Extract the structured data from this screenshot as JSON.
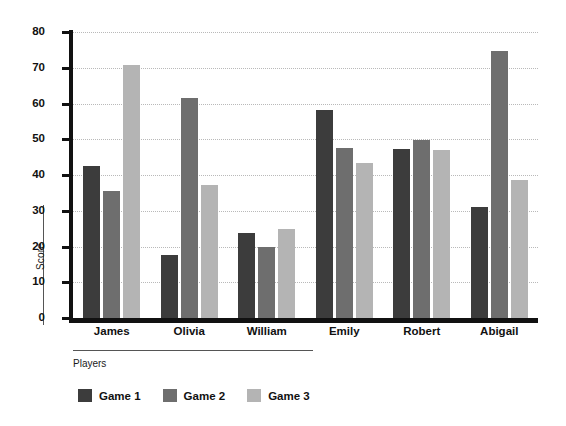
{
  "chart_data": {
    "type": "bar",
    "title": "",
    "xlabel": "Players",
    "ylabel": "Score",
    "categories": [
      "James",
      "Olivia",
      "William",
      "Emily",
      "Robert",
      "Abigail"
    ],
    "series": [
      {
        "name": "Game 1",
        "color": "#3c3c3c",
        "values": [
          42.5,
          17.7,
          23.8,
          58.3,
          47.3,
          31.0
        ]
      },
      {
        "name": "Game 2",
        "color": "#6e6e6e",
        "values": [
          35.6,
          61.5,
          19.8,
          47.5,
          49.8,
          74.8
        ]
      },
      {
        "name": "Game 3",
        "color": "#b4b4b4",
        "values": [
          70.8,
          37.3,
          25.0,
          43.5,
          47.0,
          38.5
        ]
      }
    ],
    "ylim": [
      0,
      80
    ],
    "yticks": [
      0,
      10,
      20,
      30,
      40,
      50,
      60,
      70,
      80
    ],
    "ytick_labels": [
      "0",
      "10",
      "20",
      "30",
      "40",
      "50",
      "60",
      "70",
      "80"
    ],
    "grid": "horizontal-dotted",
    "legend_position": "bottom-left"
  }
}
